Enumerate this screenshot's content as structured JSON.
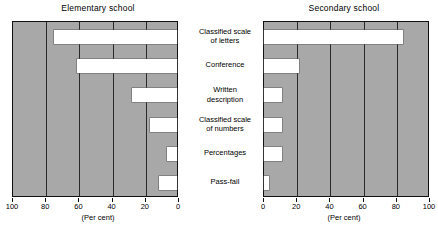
{
  "chart_data": {
    "type": "bar",
    "orientation": "horizontal",
    "layout": "back-to-back paired panels sharing centered category labels",
    "title": "",
    "xlabel": "(Per cent)",
    "ylabel": "",
    "xlim": [
      0,
      100
    ],
    "grid": true,
    "gridlines_every": 20,
    "legend": "none",
    "categories": [
      "Classified scale of letters",
      "Conference",
      "Written description",
      "Classified scale of numbers",
      "Percentages",
      "Pass-fail"
    ],
    "series": [
      {
        "name": "Elementary school",
        "axis_direction": "right-to-left",
        "tick_labels": [
          "100",
          "80",
          "60",
          "40",
          "20",
          "0"
        ],
        "values": [
          74,
          60,
          27,
          16,
          6,
          11
        ]
      },
      {
        "name": "Secondary school",
        "axis_direction": "left-to-right",
        "tick_labels": [
          "0",
          "20",
          "40",
          "60",
          "80",
          "100"
        ],
        "values": [
          84,
          21,
          11,
          11,
          11,
          3
        ]
      }
    ],
    "colors": {
      "plot_background": "#a8a8a8",
      "bar_fill": "#ffffff",
      "gridline": "#2a2a2a",
      "axis": "#111111",
      "text": "#000000"
    }
  },
  "panels": {
    "left": {
      "title": "Elementary school",
      "caption": "(Per cent)"
    },
    "right": {
      "title": "Secondary school",
      "caption": "(Per cent)"
    }
  },
  "category_labels": [
    {
      "line1": "Classified scale",
      "line2": "of letters"
    },
    {
      "line1": "Conference",
      "line2": ""
    },
    {
      "line1": "Written",
      "line2": "description"
    },
    {
      "line1": "Classified scale",
      "line2": "of numbers"
    },
    {
      "line1": "Percentages",
      "line2": ""
    },
    {
      "line1": "Pass-fail",
      "line2": ""
    }
  ]
}
